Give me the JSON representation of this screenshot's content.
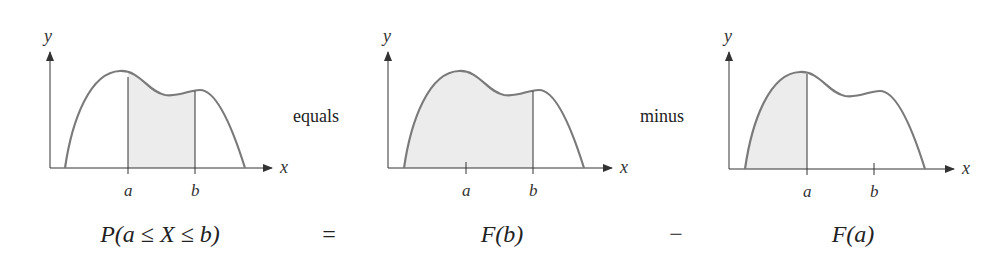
{
  "panels": [
    {
      "shaded": "between a and b",
      "x_label": "x",
      "y_label": "y",
      "tick_a": "a",
      "tick_b": "b",
      "formula": "P(a ≤ X ≤ b)"
    },
    {
      "shaded": "left of b",
      "x_label": "x",
      "y_label": "y",
      "tick_a": "a",
      "tick_b": "b",
      "formula": "F(b)"
    },
    {
      "shaded": "left of a",
      "x_label": "x",
      "y_label": "y",
      "tick_a": "a",
      "tick_b": "b",
      "formula": "F(a)"
    }
  ],
  "words": {
    "equals": "equals",
    "minus": "minus"
  },
  "operators": {
    "eq": "=",
    "minus": "−"
  },
  "colors": {
    "curve": "#7a7a7a",
    "fill": "#ececec",
    "axis": "#333333"
  }
}
